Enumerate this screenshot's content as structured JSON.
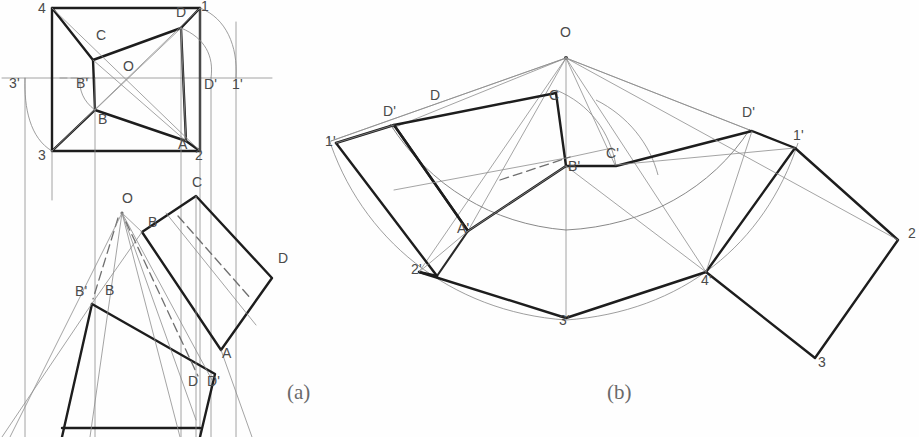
{
  "figure": {
    "title_visible": false,
    "background_color": "#fefefe",
    "heavy_line_color": "#1d1d1d",
    "thin_line_color": "#8d8d8d",
    "label_color": "#4a4a4a",
    "captions": [
      {
        "text": "(a)",
        "x": 287,
        "y": 399
      },
      {
        "text": "(b)",
        "x": 607,
        "y": 399
      }
    ],
    "panel_a": {
      "name": "top-view-and-front-view-of-truncated-pyramid",
      "labels": [
        {
          "text": "4",
          "x": 38,
          "y": 13
        },
        {
          "text": "1",
          "x": 201,
          "y": 11
        },
        {
          "text": "D",
          "x": 176,
          "y": 17
        },
        {
          "text": "C",
          "x": 96,
          "y": 40
        },
        {
          "text": "O",
          "x": 123,
          "y": 71
        },
        {
          "text": "3'",
          "x": 9,
          "y": 88
        },
        {
          "text": "B'",
          "x": 76,
          "y": 88
        },
        {
          "text": "D'",
          "x": 204,
          "y": 89
        },
        {
          "text": "1'",
          "x": 232,
          "y": 89
        },
        {
          "text": "B",
          "x": 98,
          "y": 124
        },
        {
          "text": "A",
          "x": 178,
          "y": 149
        },
        {
          "text": "3",
          "x": 38,
          "y": 160
        },
        {
          "text": "2",
          "x": 195,
          "y": 160
        },
        {
          "text": "O",
          "x": 122,
          "y": 203
        },
        {
          "text": "C",
          "x": 192,
          "y": 187
        },
        {
          "text": "B",
          "x": 148,
          "y": 227
        },
        {
          "text": "D",
          "x": 278,
          "y": 263
        },
        {
          "text": "B'",
          "x": 75,
          "y": 296
        },
        {
          "text": "B",
          "x": 105,
          "y": 295
        },
        {
          "text": "A",
          "x": 222,
          "y": 358
        },
        {
          "text": "D",
          "x": 188,
          "y": 386
        },
        {
          "text": "D'",
          "x": 207,
          "y": 386
        }
      ]
    },
    "panel_b": {
      "name": "development-unrolled-surface",
      "labels": [
        {
          "text": "O",
          "x": 560,
          "y": 37
        },
        {
          "text": "D",
          "x": 430,
          "y": 100
        },
        {
          "text": "C",
          "x": 549,
          "y": 100
        },
        {
          "text": "D'",
          "x": 383,
          "y": 116
        },
        {
          "text": "D'",
          "x": 742,
          "y": 117
        },
        {
          "text": "1'",
          "x": 325,
          "y": 146
        },
        {
          "text": "1'",
          "x": 793,
          "y": 140
        },
        {
          "text": "B'",
          "x": 568,
          "y": 171
        },
        {
          "text": "C'",
          "x": 606,
          "y": 158
        },
        {
          "text": "A'",
          "x": 457,
          "y": 233
        },
        {
          "text": "2",
          "x": 908,
          "y": 238
        },
        {
          "text": "2'",
          "x": 411,
          "y": 274
        },
        {
          "text": "4'",
          "x": 701,
          "y": 285
        },
        {
          "text": "3'",
          "x": 559,
          "y": 325
        },
        {
          "text": "3",
          "x": 818,
          "y": 367
        }
      ]
    }
  }
}
